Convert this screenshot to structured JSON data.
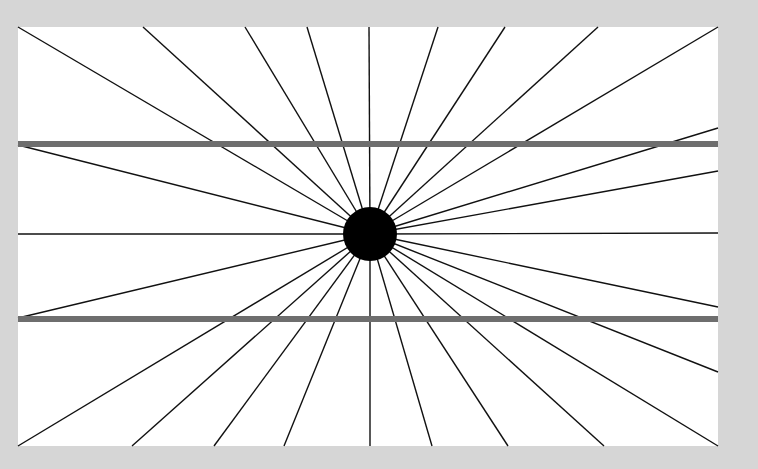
{
  "figure": {
    "type": "hering-illusion",
    "canvas": {
      "width": 758,
      "height": 469,
      "background": "#d6d6d6"
    },
    "panel": {
      "x": 18,
      "y": 27,
      "width": 700,
      "height": 419,
      "fill": "#ffffff"
    },
    "center": {
      "x": 370,
      "y": 234,
      "radius": 27,
      "fill": "#000000"
    },
    "ray_color": "#111111",
    "ray_width": 1.4,
    "rays": [
      [
        18,
        27
      ],
      [
        143,
        27
      ],
      [
        245,
        27
      ],
      [
        307,
        27
      ],
      [
        369,
        27
      ],
      [
        438,
        27
      ],
      [
        505,
        27
      ],
      [
        598,
        27
      ],
      [
        718,
        27
      ],
      [
        718,
        128
      ],
      [
        718,
        171
      ],
      [
        718,
        233
      ],
      [
        718,
        307
      ],
      [
        718,
        372
      ],
      [
        718,
        446
      ],
      [
        604,
        446
      ],
      [
        508,
        446
      ],
      [
        432,
        446
      ],
      [
        370,
        446
      ],
      [
        284,
        446
      ],
      [
        214,
        446
      ],
      [
        132,
        446
      ],
      [
        18,
        446
      ],
      [
        18,
        318
      ],
      [
        18,
        234
      ],
      [
        18,
        145
      ]
    ],
    "bars": [
      {
        "y": 144,
        "thickness": 6,
        "x1": 18,
        "x2": 718,
        "color": "#6e6e6e"
      },
      {
        "y": 319,
        "thickness": 6,
        "x1": 18,
        "x2": 718,
        "color": "#6e6e6e"
      }
    ]
  }
}
